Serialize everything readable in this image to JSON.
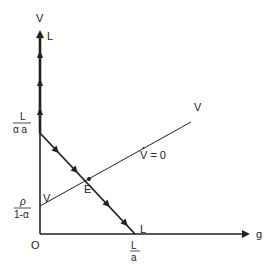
{
  "diagram": {
    "type": "phase-diagram",
    "axes": {
      "vertical_label_v": "V",
      "vertical_label_l": "L",
      "horizontal_label": "g",
      "origin_label": "O"
    },
    "intercepts": {
      "l_line_top_num": "L",
      "l_line_top_den": "α a",
      "v_line_left_num": "ρ",
      "v_line_left_den": "1-α",
      "l_line_bottom_num": "L",
      "l_line_bottom_den": "a"
    },
    "lines": {
      "l_line_end_label": "L",
      "v_line_start_label": "V",
      "v_line_end_label": "V",
      "vdot_zero_label": "V = 0",
      "equilibrium_label": "E"
    },
    "colors": {
      "line": "#222222",
      "background": "#ffffff"
    }
  }
}
